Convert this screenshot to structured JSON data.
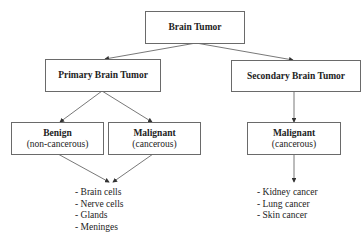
{
  "diagram": {
    "root": {
      "label": "Brain Tumor"
    },
    "primary": {
      "label": "Primary Brain Tumor"
    },
    "secondary": {
      "label": "Secondary Brain Tumor"
    },
    "benign": {
      "title": "Benign",
      "subtitle": "(non-cancerous)"
    },
    "malignant_primary": {
      "title": "Malignant",
      "subtitle": "(cancerous)"
    },
    "malignant_secondary": {
      "title": "Malignant",
      "subtitle": "(cancerous)"
    },
    "primary_sites": [
      "- Brain cells",
      "- Nerve cells",
      "- Glands",
      "- Meninges"
    ],
    "secondary_sites": [
      "- Kidney cancer",
      "- Lung cancer",
      "- Skin cancer"
    ],
    "colors": {
      "line": "#555555",
      "border": "#6a6a6a",
      "text": "#222222"
    }
  }
}
